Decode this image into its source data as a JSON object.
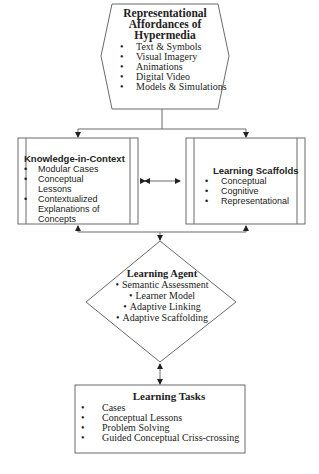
{
  "diagram": {
    "hypermedia": {
      "title_lines": [
        "Representational",
        "Affordances of",
        "Hypermedia"
      ],
      "items": [
        "Text & Symbols",
        "Visual Imagery",
        "Animations",
        "Digital Video",
        "Models & Simulations"
      ]
    },
    "knowledge_in_context": {
      "title": "Knowledge-in-Context",
      "items": [
        "Modular Cases",
        "Conceptual Lessons",
        "Contextualized Explanations of Concepts"
      ]
    },
    "learning_scaffolds": {
      "title": "Learning Scaffolds",
      "items": [
        "Conceptual",
        "Cognitive",
        "Representational"
      ]
    },
    "learning_agent": {
      "title": "Learning Agent",
      "items": [
        "Semantic Assessment",
        "Learner Model",
        "Adaptive Linking",
        "Adaptive Scaffolding"
      ]
    },
    "learning_tasks": {
      "title": "Learning Tasks",
      "items": [
        "Cases",
        "Conceptual Lessons",
        "Problem Solving",
        "Guided Conceptual Criss-crossing"
      ]
    },
    "bullet": "•",
    "colors": {
      "line": "#6a6a6a",
      "arrow": "#222222",
      "text": "#222222",
      "background": "#ffffff"
    }
  }
}
